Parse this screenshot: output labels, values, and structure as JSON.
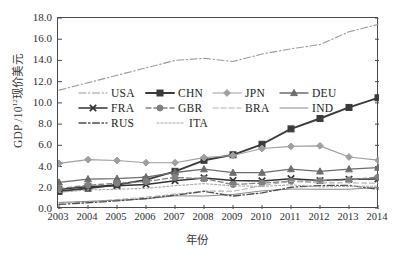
{
  "chart_data": {
    "type": "line",
    "title": "",
    "xlabel": "年份",
    "ylabel_main": "GDP /10",
    "ylabel_sup": "12",
    "ylabel_tail": "现价美元",
    "ylabel_full": "GDP /10¹²现价美元",
    "grid": false,
    "legend_position": "upper-left-inside",
    "xlim": [
      2003,
      2014
    ],
    "ylim": [
      0.0,
      18.0
    ],
    "ytick_labels": [
      "18.0",
      "16.0",
      "14.0",
      "12.0",
      "10.0",
      "8.0",
      "6.0",
      "4.0",
      "2.0",
      "0.0"
    ],
    "ytick_values": [
      18.0,
      16.0,
      14.0,
      12.0,
      10.0,
      8.0,
      6.0,
      4.0,
      2.0,
      0.0
    ],
    "categories": [
      "2003",
      "2004",
      "2005",
      "2006",
      "2007",
      "2008",
      "2009",
      "2010",
      "2011",
      "2012",
      "2013",
      "2014"
    ],
    "x": [
      2003,
      2004,
      2005,
      2006,
      2007,
      2008,
      2009,
      2010,
      2011,
      2012,
      2013,
      2014
    ],
    "series": [
      {
        "name": "USA",
        "marker": "none",
        "dash": "dashdot",
        "color": "#9a9a9a",
        "width": 1.1,
        "values": [
          11.2,
          11.9,
          12.6,
          13.3,
          14.0,
          14.2,
          13.9,
          14.6,
          15.1,
          15.5,
          16.7,
          17.4
        ]
      },
      {
        "name": "CHN",
        "marker": "square",
        "dash": "solid",
        "color": "#3b3b3b",
        "width": 1.9,
        "values": [
          1.66,
          1.96,
          2.29,
          2.75,
          3.55,
          4.59,
          5.11,
          6.1,
          7.55,
          8.53,
          9.57,
          10.48
        ]
      },
      {
        "name": "JPN",
        "marker": "diamond",
        "dash": "solid",
        "color": "#9f9f9f",
        "width": 1.2,
        "values": [
          4.3,
          4.65,
          4.57,
          4.36,
          4.36,
          4.85,
          5.04,
          5.7,
          5.9,
          5.95,
          4.9,
          4.6
        ]
      },
      {
        "name": "DEU",
        "marker": "triangle",
        "dash": "solid",
        "color": "#6d6d6d",
        "width": 1.3,
        "values": [
          2.5,
          2.82,
          2.86,
          3.0,
          3.44,
          3.75,
          3.42,
          3.42,
          3.76,
          3.54,
          3.75,
          3.9
        ]
      },
      {
        "name": "FRA",
        "marker": "x",
        "dash": "solid",
        "color": "#333333",
        "width": 1.5,
        "values": [
          1.84,
          2.12,
          2.2,
          2.32,
          2.66,
          2.93,
          2.69,
          2.65,
          2.86,
          2.68,
          2.81,
          2.83
        ]
      },
      {
        "name": "GBR",
        "marker": "circle",
        "dash": "dashed",
        "color": "#808080",
        "width": 1.3,
        "values": [
          1.92,
          2.24,
          2.42,
          2.59,
          2.98,
          2.86,
          2.31,
          2.44,
          2.62,
          2.66,
          2.74,
          3.0
        ]
      },
      {
        "name": "BRA",
        "marker": "none",
        "dash": "dashed",
        "color": "#b0b0b0",
        "width": 1.1,
        "values": [
          0.56,
          0.67,
          0.89,
          1.11,
          1.4,
          1.7,
          1.67,
          2.21,
          2.61,
          2.46,
          2.47,
          2.42
        ]
      },
      {
        "name": "IND",
        "marker": "none",
        "dash": "solid",
        "color": "#8a8a8a",
        "width": 1.0,
        "values": [
          0.62,
          0.72,
          0.83,
          0.95,
          1.24,
          1.22,
          1.37,
          1.71,
          1.88,
          1.86,
          1.86,
          2.04
        ]
      },
      {
        "name": "RUS",
        "marker": "none",
        "dash": "dashdot",
        "color": "#4f4f4f",
        "width": 1.3,
        "values": [
          0.43,
          0.59,
          0.76,
          0.99,
          1.3,
          1.66,
          1.22,
          1.52,
          2.05,
          2.21,
          2.23,
          1.86
        ]
      },
      {
        "name": "ITA",
        "marker": "none",
        "dash": "dotted",
        "color": "#a8a8a8",
        "width": 1.1,
        "values": [
          1.57,
          1.8,
          1.86,
          1.95,
          2.2,
          2.39,
          2.19,
          2.13,
          2.28,
          2.08,
          2.14,
          2.15
        ]
      }
    ]
  },
  "legend": {
    "rows": [
      [
        {
          "label": "USA"
        },
        {
          "label": "CHN"
        },
        {
          "label": "JPN"
        },
        {
          "label": "DEU"
        }
      ],
      [
        {
          "label": "FRA"
        },
        {
          "label": "GBR"
        },
        {
          "label": "BRA"
        },
        {
          "label": "IND"
        }
      ],
      [
        {
          "label": "RUS"
        },
        {
          "label": "ITA"
        }
      ]
    ]
  },
  "caption": ""
}
